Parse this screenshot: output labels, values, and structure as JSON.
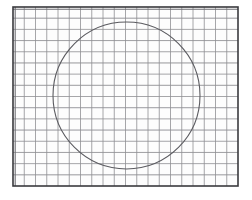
{
  "figure": {
    "title": "Circle inscribed on graph paper",
    "kind": "geometry-sketch",
    "canvas": {
      "width": 252,
      "height": 200,
      "background": "#ffffff"
    }
  },
  "grid_paper": {
    "name": "graph-paper-sheet",
    "plot_area": {
      "x": 13,
      "y": 7,
      "width": 225,
      "height": 179
    },
    "columns": 20,
    "rows": 16,
    "cell_width": 11.25,
    "cell_height": 11.1875,
    "minor_line_color": "#8f8f93",
    "minor_line_width": 0.8,
    "faint_line_color": "#d8d8dc",
    "faint_line_width": 0.7,
    "paper_fill": "#fdfdfd",
    "border": {
      "name": "sheet-border",
      "color": "#3a3a3e",
      "width": 1.6,
      "top_shadow_color": "#6f6f74",
      "left_shadow_color": "#6f6f74"
    }
  },
  "circle": {
    "name": "hand-drawn-circle",
    "center_x": 126.5,
    "center_y": 95.5,
    "radius": 73.5,
    "stroke_color": "#5b5b60",
    "stroke_width": 1.1,
    "fill": "none",
    "top_point": {
      "x": 126.5,
      "y": 22
    },
    "bottom_point": {
      "x": 126.5,
      "y": 169
    },
    "left_point": {
      "x": 53,
      "y": 95.5
    },
    "right_point": {
      "x": 200,
      "y": 95.5
    }
  },
  "chart_data": {
    "type": "scatter",
    "title": "Circle inscribed on graph paper",
    "xlabel": "",
    "ylabel": "",
    "xlim": [
      0,
      20
    ],
    "ylim": [
      0,
      16
    ],
    "grid": true,
    "legend": null,
    "annotations": [],
    "series": [
      {
        "name": "circle-outline",
        "shape": "circle",
        "center": [
          10.1,
          7.9
        ],
        "radius_x": 6.53,
        "radius_y": 6.57
      }
    ]
  }
}
